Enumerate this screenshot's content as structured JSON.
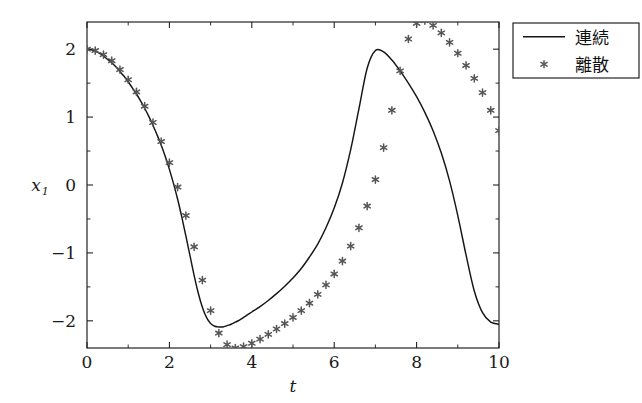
{
  "chart_data": {
    "type": "line",
    "title": "",
    "subtitle": "",
    "xlabel": "t",
    "ylabel": "x_1",
    "ylabel_base": "x",
    "ylabel_subscript": "1",
    "xlim": [
      0,
      10
    ],
    "ylim": [
      -2.4,
      2.4
    ],
    "xticks": [
      0,
      2,
      4,
      6,
      8,
      10
    ],
    "xticklabels": [
      "0",
      "2",
      "4",
      "6",
      "8",
      "10"
    ],
    "yticks": [
      -2,
      -1,
      0,
      1,
      2
    ],
    "yticklabels": [
      "−2",
      "−1",
      "0",
      "1",
      "2"
    ],
    "xminorticks": [
      1,
      3,
      5,
      7,
      9
    ],
    "yminorticks": [
      -1.5,
      -0.5,
      0.5,
      1.5
    ],
    "grid": false,
    "legend_position": "outside-top-right",
    "frame": true,
    "series": [
      {
        "name": "連続",
        "style": "line",
        "color": "#151515",
        "x": [
          0,
          0.1,
          0.2,
          0.3,
          0.4,
          0.5,
          0.6,
          0.7,
          0.8,
          0.9,
          1.0,
          1.1,
          1.2,
          1.3,
          1.4,
          1.5,
          1.6,
          1.7,
          1.8,
          1.9,
          2.0,
          2.1,
          2.2,
          2.3,
          2.4,
          2.5,
          2.6,
          2.7,
          2.8,
          2.9,
          3.0,
          3.1,
          3.2,
          3.3,
          3.4,
          3.5,
          3.6,
          3.7,
          3.8,
          3.9,
          4.0,
          4.2,
          4.4,
          4.6,
          4.8,
          5.0,
          5.2,
          5.4,
          5.6,
          5.8,
          6.0,
          6.2,
          6.4,
          6.6,
          6.8,
          7.0,
          7.2,
          7.4,
          7.6,
          7.8,
          8.0,
          8.2,
          8.4,
          8.6,
          8.8,
          9.0,
          9.2,
          9.4,
          9.6,
          9.8,
          10.0
        ],
        "y": [
          2.0,
          1.99,
          1.97,
          1.94,
          1.9,
          1.85,
          1.8,
          1.74,
          1.67,
          1.6,
          1.52,
          1.43,
          1.34,
          1.24,
          1.13,
          1.01,
          0.88,
          0.74,
          0.59,
          0.42,
          0.23,
          0.02,
          -0.21,
          -0.47,
          -0.75,
          -1.04,
          -1.33,
          -1.59,
          -1.8,
          -1.95,
          -2.04,
          -2.08,
          -2.09,
          -2.09,
          -2.07,
          -2.05,
          -2.02,
          -1.99,
          -1.95,
          -1.91,
          -1.87,
          -1.79,
          -1.7,
          -1.6,
          -1.49,
          -1.37,
          -1.23,
          -1.06,
          -0.87,
          -0.63,
          -0.34,
          0.03,
          0.52,
          1.12,
          1.72,
          1.98,
          1.96,
          1.84,
          1.68,
          1.5,
          1.3,
          1.07,
          0.8,
          0.47,
          0.06,
          -0.45,
          -1.03,
          -1.56,
          -1.88,
          -2.02,
          -2.05
        ]
      },
      {
        "name": "離散",
        "style": "markers",
        "marker": "asterisk",
        "color": "#555555",
        "x": [
          0,
          0.2,
          0.4,
          0.6,
          0.8,
          1.0,
          1.2,
          1.4,
          1.6,
          1.8,
          2.0,
          2.2,
          2.4,
          2.6,
          2.8,
          3.0,
          3.2,
          3.4,
          3.6,
          3.8,
          4.0,
          4.2,
          4.4,
          4.6,
          4.8,
          5.0,
          5.2,
          5.4,
          5.6,
          5.8,
          6.0,
          6.2,
          6.4,
          6.6,
          6.8,
          7.0,
          7.2,
          7.4,
          7.6,
          7.8,
          8.0,
          8.2,
          8.4,
          8.6,
          8.8,
          9.0,
          9.2,
          9.4,
          9.6,
          9.8,
          10.0
        ],
        "y": [
          2.0,
          1.98,
          1.92,
          1.83,
          1.7,
          1.55,
          1.37,
          1.16,
          0.92,
          0.64,
          0.33,
          -0.03,
          -0.45,
          -0.91,
          -1.4,
          -1.85,
          -2.18,
          -2.35,
          -2.4,
          -2.38,
          -2.33,
          -2.27,
          -2.2,
          -2.12,
          -2.04,
          -1.95,
          -1.85,
          -1.74,
          -1.61,
          -1.47,
          -1.31,
          -1.12,
          -0.9,
          -0.63,
          -0.31,
          0.08,
          0.55,
          1.1,
          1.68,
          2.15,
          2.38,
          2.42,
          2.35,
          2.24,
          2.1,
          1.94,
          1.76,
          1.57,
          1.36,
          1.1,
          0.8
        ]
      }
    ],
    "legend": [
      {
        "label": "連続",
        "marker": "line"
      },
      {
        "label": "離散",
        "marker": "asterisk"
      }
    ]
  },
  "geometry": {
    "plot_left": 87,
    "plot_right": 499,
    "plot_top": 22,
    "plot_bottom": 348,
    "legend_x": 513,
    "legend_y": 23,
    "legend_w": 126,
    "legend_h": 55
  }
}
